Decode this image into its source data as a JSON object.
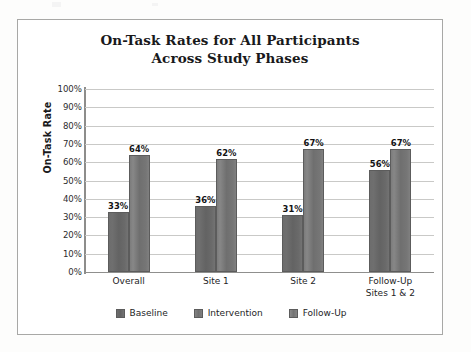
{
  "chart_data": {
    "type": "bar",
    "title": "On-Task Rates for All Participants Across Study Phases",
    "title_line1": "On-Task Rates for All Participants",
    "title_line2": "Across Study Phases",
    "xlabel": "",
    "ylabel": "On-Task Rate",
    "ylim": [
      0,
      100
    ],
    "ytick_labels": [
      "100%",
      "90%",
      "80%",
      "70%",
      "60%",
      "50%",
      "40%",
      "30%",
      "20%",
      "10%",
      "0%"
    ],
    "ytick_values": [
      100,
      90,
      80,
      70,
      60,
      50,
      40,
      30,
      20,
      10,
      0
    ],
    "grid": true,
    "legend_position": "bottom",
    "categories": [
      "Overall",
      "Site 1",
      "Site 2",
      "Follow-Up Sites 1 & 2"
    ],
    "category_labels": [
      {
        "line1": "Overall",
        "line2": ""
      },
      {
        "line1": "Site 1",
        "line2": ""
      },
      {
        "line1": "Site 2",
        "line2": ""
      },
      {
        "line1": "Follow-Up",
        "line2": "Sites 1 & 2"
      }
    ],
    "legend_entries": [
      "Baseline",
      "Intervention",
      "Follow-Up"
    ],
    "series": [
      {
        "name": "Baseline",
        "values": [
          33,
          36,
          31,
          56
        ],
        "color": "#6a6a6a"
      },
      {
        "name": "Intervention",
        "values": [
          64,
          62,
          67,
          67
        ],
        "color": "#7b7b7b"
      },
      {
        "name": "Follow-Up",
        "values": [
          null,
          null,
          null,
          null
        ],
        "color": "#858585"
      }
    ],
    "data_labels": {
      "Overall": {
        "Baseline": "33%",
        "Intervention": "64%"
      },
      "Site 1": {
        "Baseline": "36%",
        "Intervention": "62%"
      },
      "Site 2": {
        "Baseline": "31%",
        "Intervention": "67%"
      },
      "Follow-Up Sites 1 & 2": {
        "Baseline": "56%",
        "Intervention": "67%"
      }
    },
    "bars": [
      {
        "category": "Overall",
        "series": "Baseline",
        "value": 33,
        "label": "33%"
      },
      {
        "category": "Overall",
        "series": "Intervention",
        "value": 64,
        "label": "64%"
      },
      {
        "category": "Site 1",
        "series": "Baseline",
        "value": 36,
        "label": "36%"
      },
      {
        "category": "Site 1",
        "series": "Intervention",
        "value": 62,
        "label": "62%"
      },
      {
        "category": "Site 2",
        "series": "Baseline",
        "value": 31,
        "label": "31%"
      },
      {
        "category": "Site 2",
        "series": "Intervention",
        "value": 67,
        "label": "67%"
      },
      {
        "category": "Follow-Up Sites 1 & 2",
        "series": "Baseline",
        "value": 56,
        "label": "56%"
      },
      {
        "category": "Follow-Up Sites 1 & 2",
        "series": "Intervention",
        "value": 67,
        "label": "67%"
      }
    ]
  }
}
